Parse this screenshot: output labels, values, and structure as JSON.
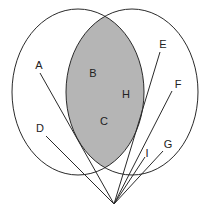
{
  "diagram": {
    "type": "venn-with-rays",
    "colors": {
      "background": "#ffffff",
      "stroke": "#2a2a2a",
      "intersection_fill": "#b5b5b5",
      "label": "#222222"
    },
    "sets": [
      {
        "name": "left-circle",
        "cx": 78,
        "cy": 92,
        "rx": 66,
        "ry": 83
      },
      {
        "name": "right-circle",
        "cx": 132,
        "cy": 92,
        "rx": 66,
        "ry": 83
      }
    ],
    "region_labels": [
      {
        "text": "B",
        "x": 93,
        "y": 77
      },
      {
        "text": "H",
        "x": 126,
        "y": 98
      },
      {
        "text": "C",
        "x": 104,
        "y": 125
      }
    ],
    "origin": {
      "x": 114,
      "y": 204
    },
    "rays": [
      {
        "label": "A",
        "lx": 39,
        "ly": 69,
        "x": 40,
        "y": 73
      },
      {
        "label": "D",
        "lx": 40,
        "ly": 132,
        "x": 46,
        "y": 136
      },
      {
        "label": "E",
        "lx": 163,
        "ly": 48,
        "x": 160,
        "y": 52
      },
      {
        "label": "F",
        "lx": 178,
        "ly": 88,
        "x": 172,
        "y": 91
      },
      {
        "label": "I",
        "lx": 147,
        "ly": 157,
        "x": 145,
        "y": 157
      },
      {
        "label": "G",
        "lx": 168,
        "ly": 148,
        "x": 163,
        "y": 151
      }
    ]
  }
}
